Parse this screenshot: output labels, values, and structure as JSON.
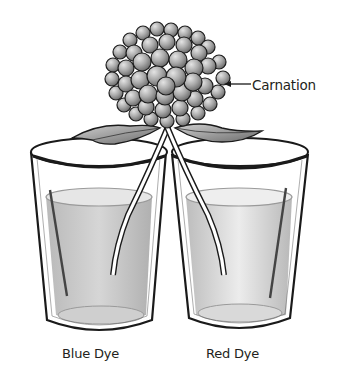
{
  "diagram": {
    "labels": {
      "flower": "Carnation",
      "left_glass": "Blue Dye",
      "right_glass": "Red Dye"
    },
    "colors": {
      "ink": "#1a1a1a",
      "petal_fill": "#a8a8a8",
      "petal_highlight": "#d8d8d8",
      "liquid": "#c6c6c6",
      "leaf": "#8a8a8a",
      "background": "#ffffff"
    }
  }
}
